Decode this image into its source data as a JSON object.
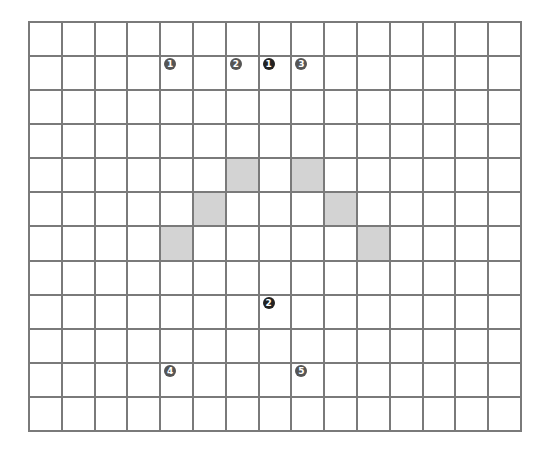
{
  "grid": {
    "columns": 15,
    "rows": 12,
    "line_color": "#7a7a7a",
    "shade_color": "#d3d3d3",
    "shaded_cells": [
      {
        "row": 4,
        "col": 6
      },
      {
        "row": 4,
        "col": 8
      },
      {
        "row": 5,
        "col": 5
      },
      {
        "row": 5,
        "col": 9
      },
      {
        "row": 6,
        "col": 4
      },
      {
        "row": 6,
        "col": 10
      }
    ],
    "markers": [
      {
        "row": 1,
        "col": 4,
        "label": "1",
        "style": "gray"
      },
      {
        "row": 1,
        "col": 6,
        "label": "2",
        "style": "gray"
      },
      {
        "row": 1,
        "col": 7,
        "label": "1",
        "style": "dark"
      },
      {
        "row": 1,
        "col": 8,
        "label": "3",
        "style": "gray"
      },
      {
        "row": 8,
        "col": 7,
        "label": "2",
        "style": "dark"
      },
      {
        "row": 10,
        "col": 4,
        "label": "4",
        "style": "gray"
      },
      {
        "row": 10,
        "col": 8,
        "label": "5",
        "style": "gray"
      }
    ]
  }
}
